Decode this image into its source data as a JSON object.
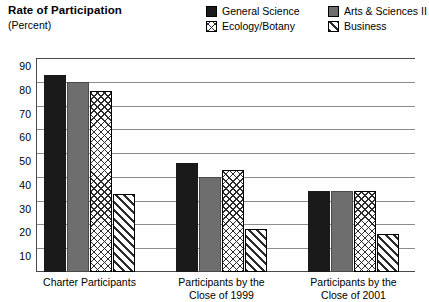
{
  "header": {
    "title": "Rate of Participation",
    "subtitle": "(Percent)"
  },
  "legend": {
    "items": [
      {
        "label": "General Science",
        "pattern": "solid-black",
        "color": "#1a1a1a"
      },
      {
        "label": "Arts & Sciences II",
        "pattern": "solid-gray",
        "color": "#6e6e6e"
      },
      {
        "label": "Ecology/Botany",
        "pattern": "crosshatch",
        "color": "#2b2b2b"
      },
      {
        "label": "Business",
        "pattern": "diagonal",
        "color": "#2b2b2b"
      }
    ]
  },
  "chart_data": {
    "type": "bar",
    "title": "Rate of Participation",
    "subtitle": "(Percent)",
    "xlabel": "",
    "ylabel": "Percent",
    "ylim": [
      0,
      90
    ],
    "yticks": [
      90,
      80,
      70,
      60,
      50,
      40,
      30,
      20,
      10
    ],
    "grid": true,
    "legend_position": "top-right",
    "categories": [
      "Charter Participants",
      "Participants by the\nClose of 1999",
      "Participants by the\nClose of 2001"
    ],
    "series": [
      {
        "name": "General Science",
        "values": [
          83,
          46,
          34
        ]
      },
      {
        "name": "Ecology/Botany",
        "values": [
          80,
          40,
          34
        ]
      },
      {
        "name": "Arts & Sciences II",
        "values": [
          76,
          43,
          34
        ]
      },
      {
        "name": "Business",
        "values": [
          33,
          18,
          16
        ]
      }
    ]
  }
}
